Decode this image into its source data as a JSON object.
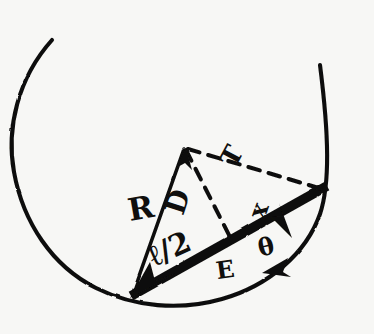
{
  "figure": {
    "kind": "hand-drawn-geometry-sketch",
    "background_color": "#f7f7f5",
    "ink_color": "#100f0d"
  },
  "labels": {
    "radius": "R",
    "distance": "D",
    "tension": "T",
    "x_offset": "x",
    "angle": "θ",
    "point_e": "E",
    "half_chord": "ℓ/2"
  },
  "elements": {
    "circle_arc": "circle-arc",
    "chord": "thick-chord",
    "radius_line": "solid-radius-line",
    "dashed_D": "dashed-perpendicular",
    "dashed_T": "dashed-tension-line",
    "arrow_radius": "arrowhead-down-left",
    "arrow_apex": "arrowhead-up-to-apex",
    "arrow_theta": "arrowhead-angle-marker",
    "arrow_chord_end": "arrowhead-along-chord"
  },
  "geometry": {
    "circle_center_x": 186,
    "circle_center_y": 166,
    "circle_radius": 136,
    "arc_gap_top_degrees": 52,
    "apex_x": 185,
    "apex_y": 148,
    "chord_left_x": 130,
    "chord_left_y": 296,
    "chord_right_x": 326,
    "chord_right_y": 186,
    "foot_x": 232,
    "foot_y": 242
  }
}
